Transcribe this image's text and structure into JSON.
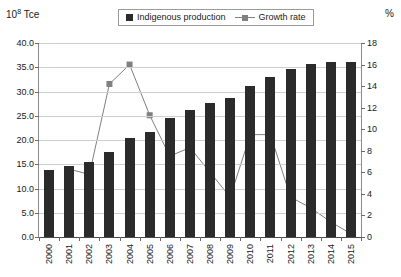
{
  "left_axis_unit": "10",
  "left_axis_unit_exponent": "8",
  "left_axis_unit_suffix": " Tce",
  "right_axis_unit": "%",
  "legend": {
    "bar_label": "Indigenous production",
    "line_label": "Growth rate"
  },
  "colors": {
    "bar": "#2b2b2b",
    "line": "#808080",
    "marker": "#808080",
    "gridline": "#cfcfcf",
    "axis": "#8c8c8c",
    "text": "#1a1a1a"
  },
  "chart_data": {
    "type": "bar",
    "title": "",
    "xlabel": "",
    "ylabel": "10^8 Tce",
    "y2label": "%",
    "grid": true,
    "legend_position": "top-center",
    "categories": [
      "2000",
      "2001",
      "2002",
      "2003",
      "2004",
      "2005",
      "2006",
      "2007",
      "2008",
      "2009",
      "2010",
      "2011",
      "2012",
      "2013",
      "2014",
      "2015"
    ],
    "ylim": [
      0.0,
      40.0
    ],
    "yticks": [
      "0.0",
      "5.0",
      "10.0",
      "15.0",
      "20.0",
      "25.0",
      "30.0",
      "35.0",
      "40.0"
    ],
    "ytick_values": [
      0.0,
      5.0,
      10.0,
      15.0,
      20.0,
      25.0,
      30.0,
      35.0,
      40.0
    ],
    "y2lim": [
      0,
      18
    ],
    "y2ticks": [
      "0",
      "2",
      "4",
      "6",
      "8",
      "10",
      "12",
      "14",
      "16",
      "18"
    ],
    "y2tick_values": [
      0,
      2,
      4,
      6,
      8,
      10,
      12,
      14,
      16,
      18
    ],
    "series": [
      {
        "name": "Indigenous production",
        "type": "bar",
        "axis": "left",
        "values": [
          13.8,
          14.7,
          15.4,
          17.6,
          20.4,
          21.6,
          24.5,
          26.2,
          27.7,
          28.6,
          31.2,
          33.0,
          34.7,
          35.7,
          36.0,
          36.1
        ]
      },
      {
        "name": "Growth rate",
        "type": "line",
        "axis": "right",
        "values": [
          null,
          6.3,
          5.8,
          14.2,
          16.0,
          11.3,
          7.5,
          8.3,
          6.0,
          3.7,
          9.5,
          9.5,
          3.7,
          2.7,
          1.4,
          0.3
        ]
      }
    ]
  }
}
